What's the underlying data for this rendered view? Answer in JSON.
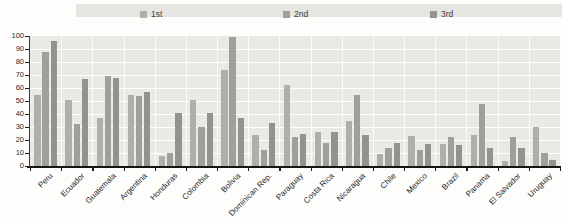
{
  "chart_data": {
    "type": "bar",
    "title": "",
    "xlabel": "",
    "ylabel": "",
    "ylim": [
      0,
      100
    ],
    "yticks": [
      0,
      10,
      20,
      30,
      40,
      50,
      60,
      70,
      80,
      90,
      100
    ],
    "grid": true,
    "legend_position": "top",
    "categories": [
      "Peru",
      "Ecuador",
      "Guatemala",
      "Argentina",
      "Honduras",
      "Colombia",
      "Bolivia",
      "Dominican Rep.",
      "Paraguay",
      "Costa Rica",
      "Nicaragua",
      "Chile",
      "Mexico",
      "Brazil",
      "Panama",
      "El Salvador",
      "Uruguay"
    ],
    "series": [
      {
        "name": "1st",
        "color": "#adb0a7",
        "values": [
          55,
          51,
          37,
          55,
          8,
          51,
          74,
          24,
          62,
          26,
          35,
          9,
          23,
          17,
          24,
          4,
          30
        ]
      },
      {
        "name": "2nd",
        "color": "#9da199",
        "values": [
          88,
          32,
          69,
          54,
          10,
          30,
          99,
          12,
          22,
          18,
          55,
          14,
          12,
          22,
          48,
          22,
          10
        ]
      },
      {
        "name": "3rd",
        "color": "#90948c",
        "values": [
          96,
          67,
          68,
          57,
          41,
          41,
          37,
          33,
          25,
          26,
          24,
          18,
          17,
          16,
          14,
          14,
          5
        ]
      }
    ]
  },
  "colors": {
    "plot_background": "#e9e9e6",
    "legend_strip_background": "#e5e5e2",
    "gridline": "#ffffff",
    "axis": "#161616",
    "text": "#1f1f1f"
  }
}
